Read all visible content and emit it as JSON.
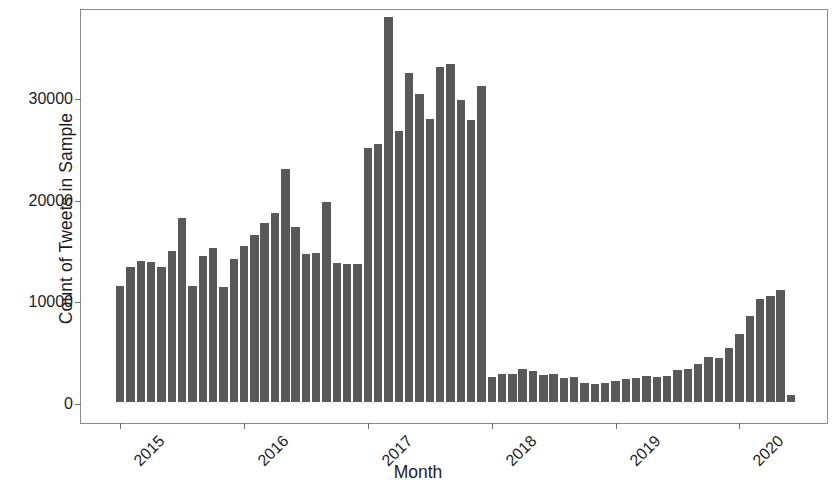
{
  "chart_data": {
    "type": "bar",
    "title": "",
    "xlabel": "Month",
    "ylabel": "Count of Tweets in Sample",
    "ylim": [
      0,
      38800
    ],
    "yticks": [
      0,
      10000,
      20000,
      30000
    ],
    "ytick_labels": [
      "0",
      "10000",
      "20000",
      "30000"
    ],
    "xticks": [
      "2015",
      "2016",
      "2017",
      "2018",
      "2019",
      "2020"
    ],
    "grid": false,
    "legend": null,
    "bar_color": "#595959",
    "panel_border_color": "#8c8c8c",
    "x_start": "2015-01",
    "x_end": "2020-06",
    "categories": [
      "2015-01",
      "2015-02",
      "2015-03",
      "2015-04",
      "2015-05",
      "2015-06",
      "2015-07",
      "2015-08",
      "2015-09",
      "2015-10",
      "2015-11",
      "2015-12",
      "2016-01",
      "2016-02",
      "2016-03",
      "2016-04",
      "2016-05",
      "2016-06",
      "2016-07",
      "2016-08",
      "2016-09",
      "2016-10",
      "2016-11",
      "2016-12",
      "2017-01",
      "2017-02",
      "2017-03",
      "2017-04",
      "2017-05",
      "2017-06",
      "2017-07",
      "2017-08",
      "2017-09",
      "2017-10",
      "2017-11",
      "2017-12",
      "2018-01",
      "2018-02",
      "2018-03",
      "2018-04",
      "2018-05",
      "2018-06",
      "2018-07",
      "2018-08",
      "2018-09",
      "2018-10",
      "2018-11",
      "2018-12",
      "2019-01",
      "2019-02",
      "2019-03",
      "2019-04",
      "2019-05",
      "2019-06",
      "2019-07",
      "2019-08",
      "2019-09",
      "2019-10",
      "2019-11",
      "2019-12",
      "2020-01",
      "2020-02",
      "2020-03",
      "2020-04",
      "2020-05",
      "2020-06"
    ],
    "values": [
      11400,
      13300,
      13900,
      13800,
      13300,
      14900,
      18100,
      11400,
      14400,
      15200,
      11300,
      14100,
      15400,
      16400,
      17600,
      18600,
      22900,
      17200,
      14600,
      14700,
      19700,
      13700,
      13600,
      13600,
      25000,
      25400,
      37900,
      26700,
      32400,
      30300,
      27900,
      33000,
      33300,
      29700,
      27800,
      31100,
      2500,
      2800,
      2800,
      3300,
      3100,
      2700,
      2800,
      2400,
      2500,
      1900,
      1800,
      1900,
      2100,
      2300,
      2400,
      2600,
      2500,
      2600,
      3200,
      3300,
      3700,
      4400,
      4300,
      5300,
      6700,
      8500,
      10100,
      10400,
      11000,
      700
    ]
  }
}
